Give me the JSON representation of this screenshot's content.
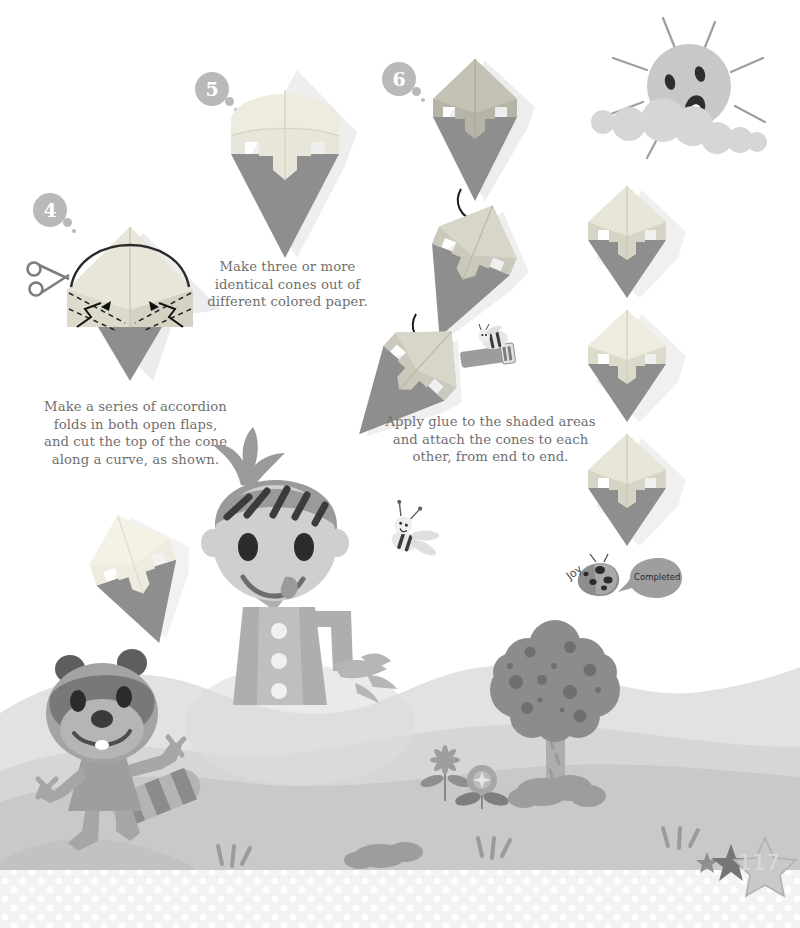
{
  "page": {
    "number": "117",
    "background_color": "#ffffff",
    "caption_color": "#6f6f6f",
    "accent_gray": "#b9b9b9",
    "paper_light": "#e8e6d8",
    "paper_mid": "#c9c7bb",
    "paper_dark": "#8e8e8e",
    "ground_color": "#c9c9c9",
    "hill_color": "#dcdcdc"
  },
  "steps": [
    {
      "id": "step-4",
      "number": "4",
      "caption": "Make a series of accordion\nfolds in both open flaps,\nand cut the top of the cone\nalong a curve, as shown.",
      "icons": [
        "scissors-icon",
        "fold-arrow-icon",
        "dashed-fold-line",
        "curve-cut-line"
      ]
    },
    {
      "id": "step-5",
      "number": "5",
      "caption": "Make three or more\nidentical cones out of\ndifferent colored paper.",
      "icons": []
    },
    {
      "id": "step-6",
      "number": "6",
      "caption": "Apply glue to the shaded areas\nand attach the cones to each\nother, from end to end.",
      "icons": [
        "curved-arrow-icon",
        "glue-stick-icon",
        "bee-icon"
      ]
    }
  ],
  "decorations": {
    "sun_label": "sun-character",
    "bee_label": "bee-character",
    "kid_label": "kid-character",
    "raccoon_label": "raccoon-character",
    "tree_label": "tree",
    "flowers_label": "flowers",
    "cone_stack_label": "finished-cone-garland"
  },
  "completion_badge": {
    "author": "Joy",
    "speech": "Completed",
    "bug": "ladybug-icon"
  },
  "footer": {
    "page_number": "117",
    "stars": [
      "small-star",
      "medium-star",
      "large-star"
    ]
  }
}
